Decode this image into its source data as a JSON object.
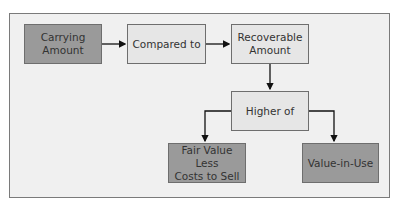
{
  "diagram": {
    "colors": {
      "frame_bg": "#f0f0f0",
      "dark_box": "#9a9a9a",
      "light_box": "#e6e6e6",
      "border": "#6e6e6e",
      "arrow": "#111111"
    },
    "nodes": [
      {
        "id": "carrying",
        "label": "Carrying Amount",
        "style": "dark"
      },
      {
        "id": "compared",
        "label": "Compared to",
        "style": "light"
      },
      {
        "id": "recoverable",
        "label": "Recoverable Amount",
        "style": "light"
      },
      {
        "id": "higher",
        "label": "Higher of",
        "style": "light"
      },
      {
        "id": "fairvalue",
        "label": "Fair Value Less Costs to Sell",
        "style": "dark"
      },
      {
        "id": "viu",
        "label": "Value-in-Use",
        "style": "dark"
      }
    ],
    "edges": [
      {
        "from": "carrying",
        "to": "compared"
      },
      {
        "from": "compared",
        "to": "recoverable"
      },
      {
        "from": "recoverable",
        "to": "higher"
      },
      {
        "from": "higher",
        "to": "fairvalue"
      },
      {
        "from": "higher",
        "to": "viu"
      }
    ]
  },
  "labels": {
    "carrying_line1": "Carrying",
    "carrying_line2": "Amount",
    "compared": "Compared to",
    "recoverable_line1": "Recoverable",
    "recoverable_line2": "Amount",
    "higher": "Higher of",
    "fairvalue_line1": "Fair Value Less",
    "fairvalue_line2": "Costs to Sell",
    "viu": "Value-in-Use"
  }
}
